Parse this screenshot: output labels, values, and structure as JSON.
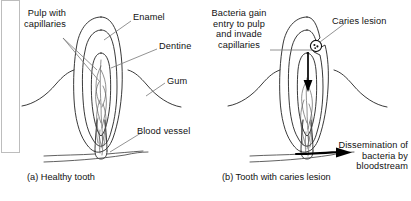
{
  "figure": {
    "title_implicit": "Dental caries and bacteraemia diagram",
    "background": "#ffffff",
    "ink": "#1a1a1a",
    "panels": [
      {
        "id": "a",
        "caption": "(a) Healthy tooth",
        "labels": [
          {
            "name": "pulp-with-capillaries",
            "text": "Pulp with\ncapillaries"
          },
          {
            "name": "enamel",
            "text": "Enamel"
          },
          {
            "name": "dentine",
            "text": "Dentine"
          },
          {
            "name": "gum",
            "text": "Gum"
          },
          {
            "name": "blood-vessel",
            "text": "Blood vessel"
          }
        ]
      },
      {
        "id": "b",
        "caption": "(b) Tooth with caries lesion",
        "labels": [
          {
            "name": "bacteria-gain-entry",
            "text": "Bacteria gain\nentry to pulp\nand invade\ncapillaries"
          },
          {
            "name": "caries-lesion",
            "text": "Caries lesion"
          },
          {
            "name": "dissemination",
            "text": "Dissemination of\nbacteria by\nbloodstream"
          }
        ]
      }
    ]
  },
  "panel_a": {
    "caption": "(a) Healthy tooth",
    "label_pulp": "Pulp with\ncapillaries",
    "label_enamel": "Enamel",
    "label_dentine": "Dentine",
    "label_gum": "Gum",
    "label_blood_vessel": "Blood vessel"
  },
  "panel_b": {
    "caption": "(b) Tooth with caries lesion",
    "label_bacteria": "Bacteria gain\nentry to pulp\nand invade\ncapillaries",
    "label_caries": "Caries lesion",
    "label_dissemination": "Dissemination of\nbacteria by\nbloodstream"
  },
  "colors": {
    "line": "#222222",
    "thin_line": "#555555",
    "arrow": "#000000",
    "frame": "#b8b8b8",
    "text": "#111111"
  }
}
